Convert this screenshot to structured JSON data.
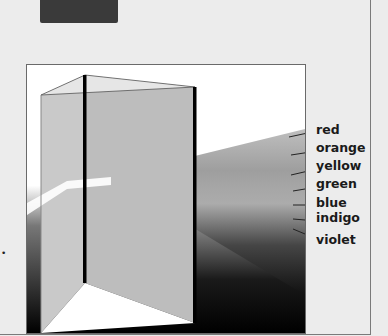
{
  "figure": {
    "labels": [
      {
        "text": "red",
        "top": 123
      },
      {
        "text": "orange",
        "top": 141
      },
      {
        "text": "yellow",
        "top": 159
      },
      {
        "text": "green",
        "top": 177
      },
      {
        "text": "blue",
        "top": 196
      },
      {
        "text": "indigo",
        "top": 211
      },
      {
        "text": "violet",
        "top": 233
      }
    ]
  },
  "stray_mark": "•"
}
